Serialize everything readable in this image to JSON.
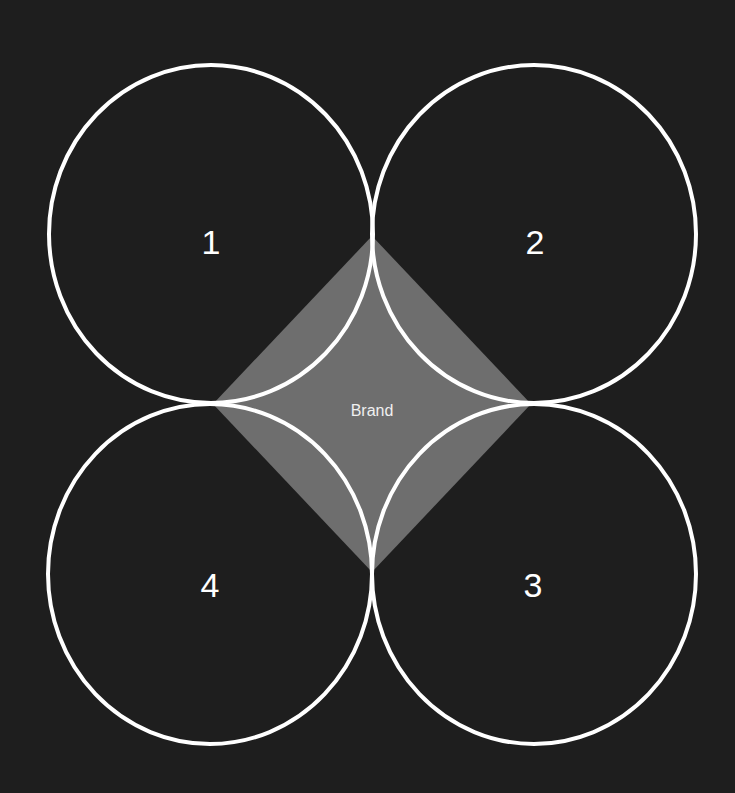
{
  "diagram": {
    "center_label": "Brand",
    "circles": [
      {
        "label": "1",
        "position": "top-left"
      },
      {
        "label": "2",
        "position": "top-right"
      },
      {
        "label": "3",
        "position": "bottom-right"
      },
      {
        "label": "4",
        "position": "bottom-left"
      }
    ],
    "colors": {
      "background": "#1e1e1e",
      "circle_stroke": "#ffffff",
      "diamond_fill": "#6e6e6e",
      "text": "#ffffff"
    }
  }
}
